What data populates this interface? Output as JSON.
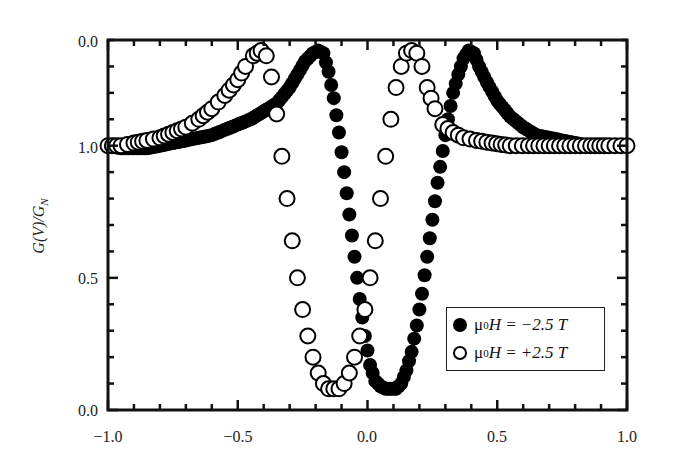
{
  "chart_data": {
    "type": "scatter",
    "title": "",
    "xlabel": "",
    "ylabel": "G(V)/G_N",
    "xlim": [
      -1.0,
      1.0
    ],
    "ylim": [
      0.0,
      1.4
    ],
    "x_ticks": [
      "-1.0",
      "-0.5",
      "0.0",
      "0.5",
      "1.0"
    ],
    "y_ticks": [
      "0.0",
      "0.5",
      "1.0",
      "0.0"
    ],
    "y_tick_values": [
      0.0,
      0.5,
      1.0,
      1.4
    ],
    "grid": false,
    "legend_position": "lower right",
    "series": [
      {
        "name": "μ0H = −2.5 T",
        "marker": "filled-circle",
        "x": [
          -1.0,
          -0.95,
          -0.9,
          -0.85,
          -0.8,
          -0.75,
          -0.7,
          -0.65,
          -0.6,
          -0.55,
          -0.5,
          -0.45,
          -0.4,
          -0.35,
          -0.3,
          -0.27,
          -0.24,
          -0.21,
          -0.19,
          -0.17,
          -0.15,
          -0.13,
          -0.11,
          -0.09,
          -0.07,
          -0.05,
          -0.03,
          -0.01,
          0.01,
          0.03,
          0.05,
          0.07,
          0.09,
          0.11,
          0.13,
          0.15,
          0.17,
          0.19,
          0.21,
          0.23,
          0.25,
          0.27,
          0.29,
          0.31,
          0.33,
          0.35,
          0.37,
          0.39,
          0.41,
          0.43,
          0.46,
          0.5,
          0.55,
          0.6,
          0.65,
          0.7,
          0.75,
          0.8,
          0.85,
          0.9,
          0.95,
          1.0
        ],
        "y": [
          1.0,
          0.99,
          0.99,
          0.99,
          1.0,
          1.01,
          1.02,
          1.03,
          1.04,
          1.06,
          1.08,
          1.1,
          1.13,
          1.16,
          1.22,
          1.27,
          1.32,
          1.35,
          1.36,
          1.35,
          1.28,
          1.18,
          1.05,
          0.9,
          0.74,
          0.58,
          0.42,
          0.28,
          0.17,
          0.11,
          0.09,
          0.08,
          0.08,
          0.08,
          0.1,
          0.15,
          0.22,
          0.32,
          0.44,
          0.58,
          0.72,
          0.86,
          0.98,
          1.1,
          1.2,
          1.27,
          1.33,
          1.36,
          1.35,
          1.3,
          1.24,
          1.17,
          1.11,
          1.07,
          1.04,
          1.03,
          1.02,
          1.01,
          1.0,
          1.0,
          1.0,
          1.0
        ]
      },
      {
        "name": "μ0H = +2.5 T",
        "marker": "open-circle",
        "x": [
          -1.0,
          -0.95,
          -0.9,
          -0.85,
          -0.8,
          -0.75,
          -0.7,
          -0.65,
          -0.6,
          -0.55,
          -0.5,
          -0.47,
          -0.44,
          -0.41,
          -0.39,
          -0.37,
          -0.35,
          -0.33,
          -0.31,
          -0.29,
          -0.27,
          -0.25,
          -0.23,
          -0.21,
          -0.19,
          -0.17,
          -0.15,
          -0.13,
          -0.11,
          -0.09,
          -0.07,
          -0.05,
          -0.03,
          -0.01,
          0.01,
          0.03,
          0.05,
          0.07,
          0.09,
          0.11,
          0.13,
          0.15,
          0.17,
          0.19,
          0.21,
          0.23,
          0.26,
          0.29,
          0.33,
          0.37,
          0.42,
          0.48,
          0.55,
          0.62,
          0.7,
          0.78,
          0.86,
          0.93,
          1.0
        ],
        "y": [
          1.0,
          1.0,
          1.01,
          1.02,
          1.03,
          1.05,
          1.07,
          1.1,
          1.14,
          1.19,
          1.25,
          1.3,
          1.34,
          1.36,
          1.34,
          1.26,
          1.12,
          0.96,
          0.8,
          0.64,
          0.5,
          0.38,
          0.28,
          0.2,
          0.14,
          0.1,
          0.08,
          0.08,
          0.08,
          0.1,
          0.14,
          0.2,
          0.28,
          0.38,
          0.5,
          0.64,
          0.8,
          0.96,
          1.1,
          1.22,
          1.3,
          1.35,
          1.36,
          1.35,
          1.3,
          1.22,
          1.14,
          1.08,
          1.05,
          1.03,
          1.02,
          1.01,
          1.0,
          1.0,
          1.0,
          1.0,
          1.0,
          1.0,
          1.0
        ]
      }
    ]
  },
  "axes": {
    "ylabel": "G(V)/G",
    "ylabel_sub": "N",
    "x_tick_labels": [
      "−1.0",
      "−0.5",
      "0.0",
      "0.5",
      "1.0"
    ],
    "y_tick_labels": [
      "0.0",
      "0.5",
      "1.0",
      "0.0"
    ]
  },
  "legend": {
    "items": [
      {
        "prefix": "μ",
        "sub": "0",
        "text": "H = −2.5 T"
      },
      {
        "prefix": "μ",
        "sub": "0",
        "text": "H = +2.5 T"
      }
    ]
  }
}
